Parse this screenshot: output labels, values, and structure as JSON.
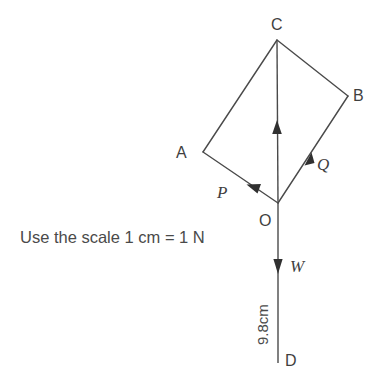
{
  "figure": {
    "background_color": "#ffffff",
    "line_color": "#4a4a4a",
    "text_color": "#3f3f3f",
    "vertices": {
      "A": {
        "label": "A",
        "x": 203,
        "y": 152,
        "label_x": 176,
        "label_y": 158
      },
      "B": {
        "label": "B",
        "x": 348,
        "y": 96,
        "label_x": 353,
        "label_y": 101
      },
      "C": {
        "label": "C",
        "x": 277,
        "y": 40,
        "label_x": 271,
        "label_y": 30
      },
      "O": {
        "label": "O",
        "x": 278,
        "y": 203,
        "label_x": 259,
        "label_y": 226
      },
      "D": {
        "label": "D",
        "x": 278,
        "y": 363,
        "label_x": 285,
        "label_y": 366
      }
    },
    "forces": [
      {
        "name": "P",
        "label": "P",
        "label_x": 217,
        "label_y": 198,
        "from": "O",
        "to": "A",
        "head_x": 249,
        "head_y": 186
      },
      {
        "name": "Q",
        "label": "Q",
        "label_x": 317,
        "label_y": 170,
        "from": "O",
        "to": "B",
        "head_x": 310,
        "head_y": 156
      },
      {
        "name": "R",
        "label": "",
        "from": "O",
        "to": "C",
        "head_x": 277,
        "head_y": 126
      },
      {
        "name": "W",
        "label": "W",
        "label_x": 290,
        "label_y": 272,
        "from": "O",
        "to": "D",
        "head_x": 278,
        "head_y": 270
      }
    ],
    "edges": [
      {
        "from": "A",
        "to": "C"
      },
      {
        "from": "C",
        "to": "B"
      },
      {
        "from": "B",
        "to": "O"
      },
      {
        "from": "O",
        "to": "A"
      },
      {
        "from": "O",
        "to": "C"
      },
      {
        "from": "O",
        "to": "D"
      }
    ],
    "annotations": {
      "scale_note": "Use the scale 1 cm = 1 N",
      "scale_note_x": 20,
      "scale_note_y": 243,
      "dimension_label": "9.8cm",
      "dimension_x": 268,
      "dimension_y": 345
    }
  }
}
